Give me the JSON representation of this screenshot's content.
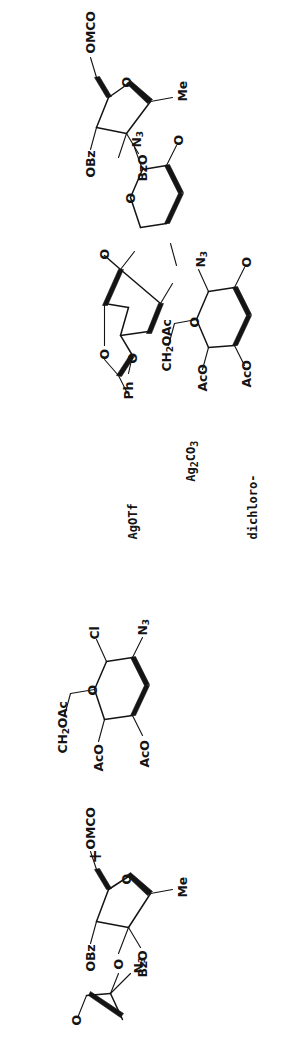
{
  "document": {
    "kind": "chemical-reaction-scheme",
    "orientation": "rotated-90-counterclockwise",
    "background_color": "#ffffff",
    "ink_color": "#141414"
  },
  "scheme": {
    "acceptor": {
      "name": "disaccharide-acceptor",
      "labels": [
        "OBz",
        "OMCO",
        "O",
        "N3",
        "BzO",
        "Me",
        "O"
      ],
      "label_text": {
        "obz": "OBz",
        "omco": "OMCO",
        "ring_oxygen": "O",
        "azide": "N",
        "azide_sub": "3",
        "bzo": "BzO",
        "me": "Me",
        "linking_oxygen": "O"
      }
    },
    "plus_sign": "+",
    "donor": {
      "name": "glycosyl-chloride-donor",
      "label_text": {
        "ch2oac": "CH",
        "ch2oac_sub": "2",
        "ch2oac_tail": "OAc",
        "ring_oxygen": "O",
        "chloride": "Cl",
        "azide": "N",
        "azide_sub": "3",
        "aco_top": "AcO",
        "aco_bottom": "AcO"
      }
    },
    "reagents": {
      "name": "reaction-conditions",
      "lines": [
        "AgOTf",
        "Ag2CO3",
        "dichloro-",
        "methane"
      ],
      "line_rich": [
        {
          "text": "AgOTf"
        },
        {
          "pre": "Ag",
          "sub1": "2",
          "mid": "CO",
          "sub2": "3"
        },
        {
          "text": "dichloro-"
        },
        {
          "text": "methane"
        }
      ]
    },
    "product": {
      "name": "trisaccharide-product",
      "label_text": {
        "ph": "Ph",
        "acetal_oxygen_upper": "O",
        "acetal_oxygen_lower": "O",
        "ch2oac": "CH",
        "ch2oac_sub": "2",
        "ch2oac_tail": "OAc",
        "aco_top": "AcO",
        "aco_bottom": "AcO",
        "ring_oxygen_left": "O",
        "azide_left": "N",
        "azide_left_sub": "3",
        "glycosidic_oxygen_left": "O",
        "ring_oxygen_mid": "O",
        "azide_mid": "N",
        "azide_mid_sub": "3",
        "glycosidic_oxygen_mid": "O",
        "obz": "OBz",
        "omco": "OMCO",
        "bzo": "BzO",
        "me": "Me",
        "ring_oxygen_right": "O"
      }
    }
  }
}
